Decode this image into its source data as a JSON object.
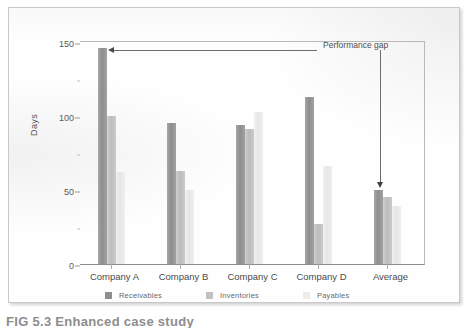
{
  "figure": {
    "caption": "FIG 5.3   Enhanced case study",
    "annotation": {
      "label": "Performance gap"
    }
  },
  "chart_data": {
    "type": "bar",
    "title": "",
    "xlabel": "",
    "ylabel": "Days",
    "ylim": [
      0,
      150
    ],
    "yticks": [
      0,
      50,
      100,
      150
    ],
    "yminor": [
      25,
      75,
      125
    ],
    "grid": false,
    "legend_position": "bottom",
    "categories": [
      "Company A",
      "Company B",
      "Company C",
      "Company D",
      "Average"
    ],
    "series": [
      {
        "name": "Receivables",
        "color": "#8e8e8e",
        "values": [
          146,
          95,
          94,
          113,
          50
        ]
      },
      {
        "name": "Inventories",
        "color": "#c2c2c2",
        "values": [
          100,
          63,
          91,
          27,
          45
        ]
      },
      {
        "name": "Payables",
        "color": "#ececec",
        "values": [
          62,
          50,
          103,
          66,
          39
        ]
      }
    ],
    "annotations": [
      {
        "text": "Performance gap",
        "from": "Company A Receivables",
        "to": "Average Receivables"
      }
    ]
  }
}
